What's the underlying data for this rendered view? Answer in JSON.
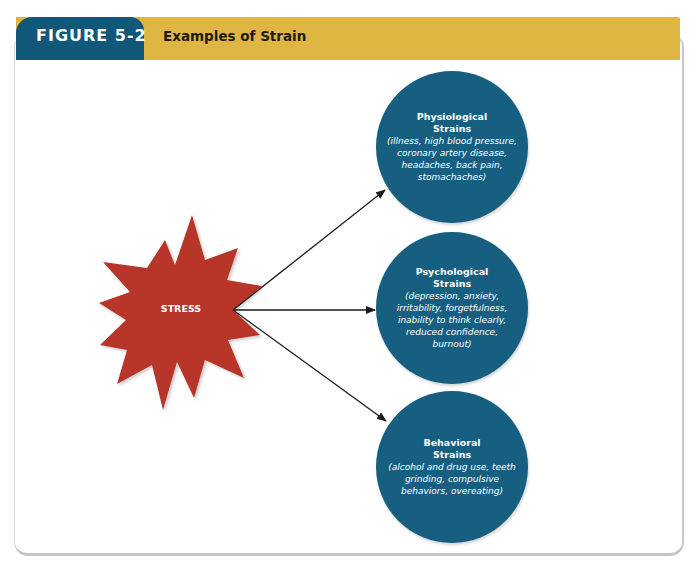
{
  "figure": {
    "label": "FIGURE 5-2",
    "title": "Examples of Strain"
  },
  "colors": {
    "header_tab": "#11577a",
    "header_bar": "#dfb644",
    "circle_fill": "#165f80",
    "starburst_fill": "#b8342a",
    "arrow": "#1a1a1a"
  },
  "diagram": {
    "source": {
      "label": "STRESS",
      "shape": "starburst"
    },
    "arrows": [
      {
        "from": "STRESS",
        "to": "Physiological Strains"
      },
      {
        "from": "STRESS",
        "to": "Psychological Strains"
      },
      {
        "from": "STRESS",
        "to": "Behavioral Strains"
      }
    ],
    "nodes": [
      {
        "title": "Physiological Strains",
        "description": "(illness, high blood pressure, coronary artery disease, headaches, back pain, stomachaches)"
      },
      {
        "title": "Psychological Strains",
        "description": "(depression, anxiety, irritability, forgetfulness, inability to think clearly, reduced confidence, burnout)"
      },
      {
        "title": "Behavioral Strains",
        "description": "(alcohol and drug use, teeth grinding, compulsive behaviors, overeating)"
      }
    ]
  }
}
